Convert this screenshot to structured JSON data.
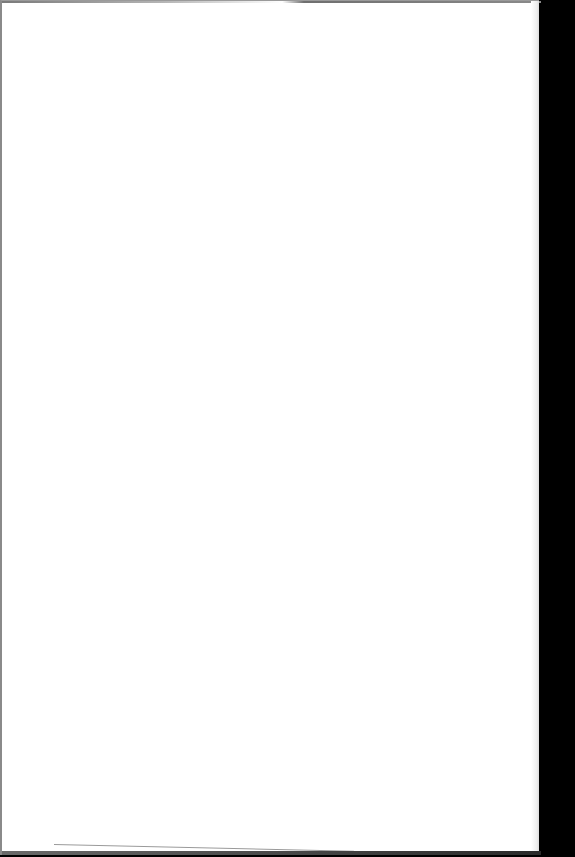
{
  "document": {
    "type": "scanned-page",
    "content": "",
    "page_color": "#ffffff",
    "background_color": "#000000",
    "border_color": "#8a8a8a"
  }
}
